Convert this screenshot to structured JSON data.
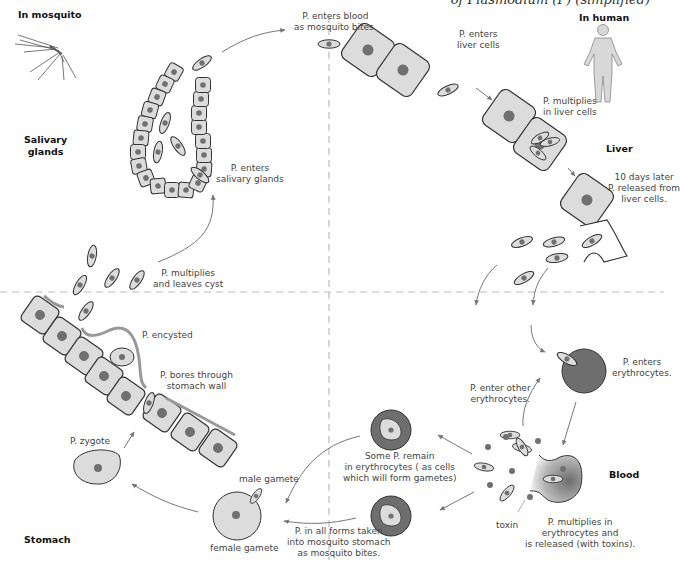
{
  "title": "of Plasmodium (P) (simplified)",
  "regions": {
    "in_mosquito": "In mosquito",
    "in_human": "In human",
    "salivary_glands": [
      "Salivary",
      "glands"
    ],
    "liver": "Liver",
    "blood": "Blood",
    "stomach": "Stomach"
  },
  "labels": {
    "enters_blood": [
      "P. enters blood",
      "as mosquito bites."
    ],
    "enters_salivary": [
      "P. enters",
      "salivary glands"
    ],
    "multiplies_leaves_cyst": [
      "P. multiplies",
      "and leaves cyst"
    ],
    "encysted": "P. encysted",
    "bores_wall": [
      "P. bores through",
      "stomach wall"
    ],
    "zygote": "P. zygote",
    "male_gamete": "male gamete",
    "female_gamete": "female gamete",
    "all_forms": [
      "P. in all forms taken",
      "into mosquito stomach",
      "as mosquito bites."
    ],
    "some_remain": [
      "Some P. remain",
      "in erythrocytes ( as cells",
      "which will form gametes)"
    ],
    "enter_other": [
      "P. enter other",
      "erythrocytes."
    ],
    "enters_erythrocytes": [
      "P. enters",
      "erythrocytes."
    ],
    "multiplies_erythrocytes": [
      "P. multiplies in",
      "erythrocytes and",
      "is released (with toxins)."
    ],
    "toxin": "toxin",
    "enters_liver": [
      "P. enters",
      "liver cells"
    ],
    "multiplies_liver": [
      "P. multiplies",
      "in liver cells"
    ],
    "released_liver": [
      "10 days later",
      "P. released from",
      "liver cells."
    ]
  },
  "colors": {
    "cell_fill": "#dcdcdc",
    "nucleus": "#707070",
    "erythrocyte": "#6e6e6e",
    "outline": "#333333",
    "arrow": "#777777",
    "divider": "#bbbbbb",
    "text": "#444444"
  }
}
